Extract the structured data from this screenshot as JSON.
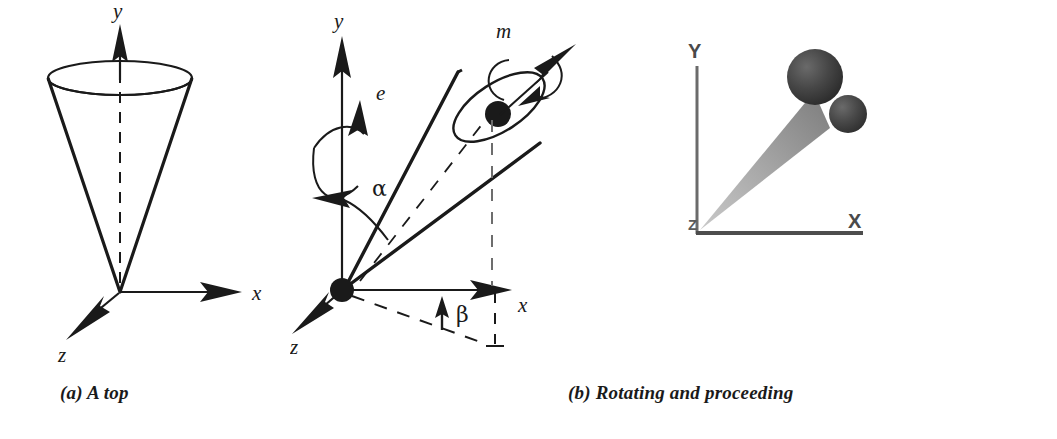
{
  "figure": {
    "background": "#ffffff",
    "ink": "#1a1a1a",
    "gray_axis": "#6b6b6b",
    "sphere_dark": "#3a3a3a"
  },
  "panels": [
    {
      "id": "a",
      "caption": "(a) A top",
      "axes": [
        {
          "name": "y",
          "label": "y",
          "direction": "up"
        },
        {
          "name": "x",
          "label": "x",
          "direction": "right"
        },
        {
          "name": "z",
          "label": "z",
          "direction": "down-left"
        }
      ],
      "objects": [
        "cone",
        "dashed-symmetry-axis",
        "base-ellipse"
      ]
    },
    {
      "id": "b",
      "caption": "(b) Rotating and proceeding",
      "axes": [
        {
          "name": "y",
          "label": "y",
          "direction": "up"
        },
        {
          "name": "x",
          "label": "x",
          "direction": "right"
        },
        {
          "name": "z",
          "label": "z",
          "direction": "down-left"
        }
      ],
      "annotations": [
        {
          "name": "precession",
          "label": "e"
        },
        {
          "name": "nutation-angle",
          "label": "α"
        },
        {
          "name": "azimuth-angle",
          "label": "β"
        },
        {
          "name": "spin-axis-mass",
          "label": "m"
        }
      ],
      "objects": [
        "tilted-cone",
        "base-ellipse",
        "mass-point",
        "spin-arrow",
        "origin-dot",
        "dashed-projection"
      ]
    },
    {
      "id": "c",
      "caption": "(c) A Top in generalized solar system",
      "axes": [
        {
          "name": "Y",
          "label": "Y",
          "direction": "up"
        },
        {
          "name": "X",
          "label": "X",
          "direction": "right"
        },
        {
          "name": "Z",
          "label": "Z",
          "direction": "origin"
        }
      ],
      "objects": [
        "gray-cone",
        "large-sphere",
        "small-sphere"
      ]
    }
  ]
}
